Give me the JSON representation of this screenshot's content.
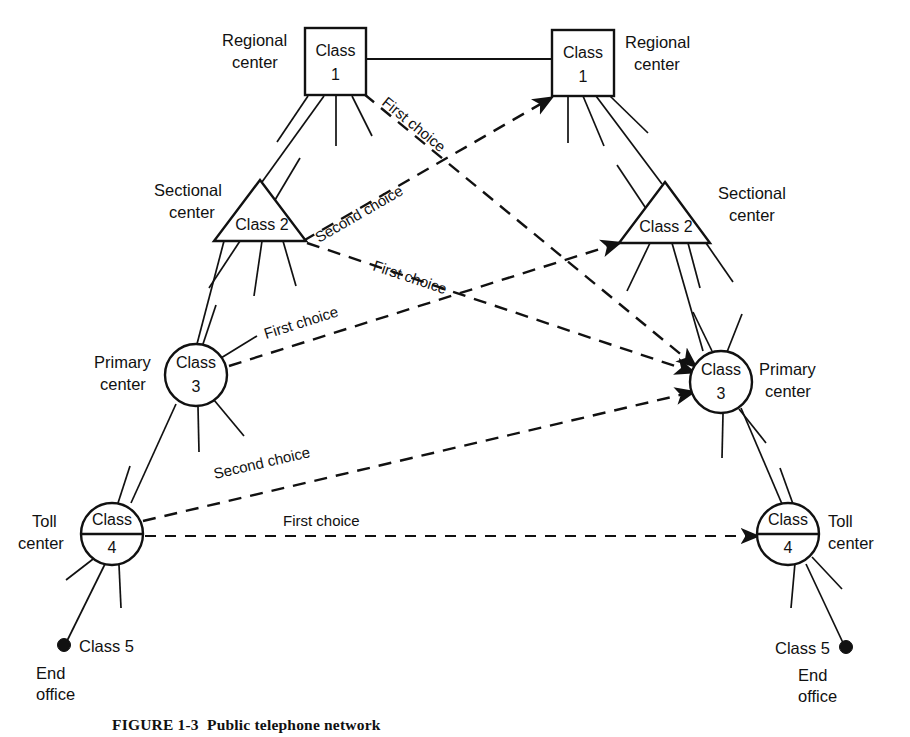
{
  "figure": {
    "caption_number": "FIGURE 1-3",
    "caption_text": "Public telephone network"
  },
  "nodes": [
    {
      "id": "class1-left",
      "class_word": "Class",
      "class_number": "1",
      "role_line1": "Regional",
      "role_line2": "center",
      "shape": "square",
      "side": "left"
    },
    {
      "id": "class1-right",
      "class_word": "Class",
      "class_number": "1",
      "role_line1": "Regional",
      "role_line2": "center",
      "shape": "square",
      "side": "right"
    },
    {
      "id": "class2-left",
      "class_label": "Class 2",
      "role_line1": "Sectional",
      "role_line2": "center",
      "shape": "triangle",
      "side": "left"
    },
    {
      "id": "class2-right",
      "class_label": "Class 2",
      "role_line1": "Sectional",
      "role_line2": "center",
      "shape": "triangle",
      "side": "right"
    },
    {
      "id": "class3-left",
      "class_word": "Class",
      "class_number": "3",
      "role_line1": "Primary",
      "role_line2": "center",
      "shape": "circle",
      "side": "left"
    },
    {
      "id": "class3-right",
      "class_word": "Class",
      "class_number": "3",
      "role_line1": "Primary",
      "role_line2": "center",
      "shape": "circle",
      "side": "right"
    },
    {
      "id": "class4-left",
      "class_word": "Class",
      "class_number": "4",
      "role_line1": "Toll",
      "role_line2": "center",
      "shape": "circle-barred",
      "side": "left"
    },
    {
      "id": "class4-right",
      "class_word": "Class",
      "class_number": "4",
      "role_line1": "Toll",
      "role_line2": "center",
      "shape": "circle-barred",
      "side": "right"
    },
    {
      "id": "class5-left",
      "class_label": "Class 5",
      "role_line1": "End",
      "role_line2": "office",
      "shape": "dot",
      "side": "left"
    },
    {
      "id": "class5-right",
      "class_label": "Class 5",
      "role_line1": "End",
      "role_line2": "office",
      "shape": "dot",
      "side": "right"
    }
  ],
  "edge_labels": {
    "first_choice": "First choice",
    "second_choice": "Second choice"
  },
  "routes": [
    {
      "id": "route-c1l-to-c3r",
      "label": "First choice",
      "from": "class1-left",
      "to": "class3-right"
    },
    {
      "id": "route-c2l-to-c1r",
      "label": "Second choice",
      "from": "class2-left",
      "to": "class1-right"
    },
    {
      "id": "route-c2l-to-c3r",
      "label": "First choice",
      "from": "class2-left",
      "to": "class3-right"
    },
    {
      "id": "route-c3l-to-c2r",
      "label": "First choice",
      "from": "class3-left",
      "to": "class2-right"
    },
    {
      "id": "route-c4l-to-c3r",
      "label": "Second choice",
      "from": "class4-left",
      "to": "class3-right"
    },
    {
      "id": "route-c4l-to-c4r",
      "label": "First choice",
      "from": "class4-left",
      "to": "class4-right"
    }
  ],
  "colors": {
    "ink": "#111111",
    "paper": "#ffffff"
  }
}
